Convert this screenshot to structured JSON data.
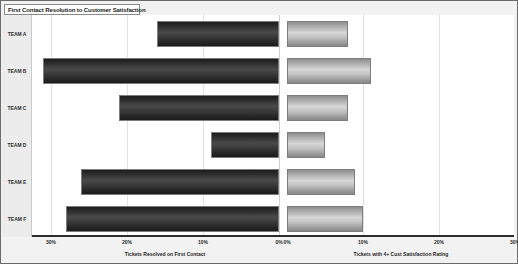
{
  "title": "First Contact Resolution to Customer Satisfaction",
  "colors": {
    "left_series_dark": "#2e2e2e",
    "right_series_light": "#c2c2c2",
    "frame_border": "#6b6b6b",
    "panel_background": "#f2f2f2",
    "plot_background": "#ffffff",
    "gridline": "#e2e2e2",
    "axis_line": "#2b2b2b"
  },
  "chart_data": {
    "type": "bar",
    "orientation": "horizontal",
    "layout": "butterfly",
    "title": "First Contact Resolution to Customer Satisfaction",
    "categories": [
      "TEAM A",
      "TEAM B",
      "TEAM C",
      "TEAM D",
      "TEAM E",
      "TEAM F"
    ],
    "series": [
      {
        "name": "Tickets Resolved on First Contact",
        "side": "left",
        "values": [
          16,
          31,
          21,
          9,
          26,
          28
        ]
      },
      {
        "name": "Tickets with 4+ Cust Satisfaction Rating",
        "side": "right",
        "values": [
          8,
          11,
          8,
          5,
          9,
          10
        ]
      }
    ],
    "left_axis": {
      "label": "Tickets Resolved on First Contact",
      "ticks": [
        "30%",
        "20%",
        "10%",
        "0%"
      ],
      "tick_values": [
        30,
        20,
        10,
        0
      ],
      "range": [
        30,
        0
      ]
    },
    "right_axis": {
      "label": "Tickets with 4+ Cust Satisfaction Rating",
      "ticks": [
        "0%",
        "10%",
        "20%",
        "30%"
      ],
      "tick_values": [
        0,
        10,
        20,
        30
      ],
      "range": [
        0,
        30
      ]
    },
    "grid": true,
    "legend": "none",
    "xlabel": "",
    "ylabel": ""
  }
}
